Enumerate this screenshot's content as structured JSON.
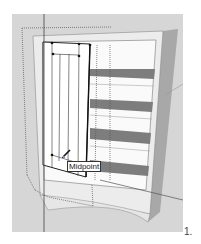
{
  "viewport": {
    "background": "#d6d6d6",
    "model": "cabinet-with-shelves",
    "tool_state": "drawing-door-rectangle"
  },
  "inference_tooltip": {
    "label": "Midpoint"
  },
  "figure": {
    "step_label": "1."
  },
  "colors": {
    "cabinet_face": "#f2f2f2",
    "cabinet_side": "#a8a8a8",
    "shelf_dark": "#7d7d7d",
    "edge": "#222222",
    "dotted_guide": "#555555"
  }
}
